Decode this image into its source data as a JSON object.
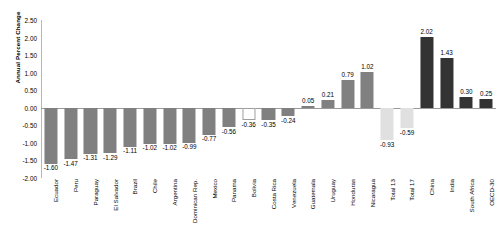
{
  "chart_data": {
    "type": "bar",
    "title": "",
    "xlabel": "",
    "ylabel": "Annual Percent Change",
    "ylim": [
      -2.0,
      2.5
    ],
    "ytick_labels": [
      "2.50",
      "2.00",
      "1.50",
      "1.00",
      "0.50",
      "0.00",
      "-0.50",
      "-1.00",
      "-1.50",
      "-2.00"
    ],
    "ytick_values": [
      2.5,
      2.0,
      1.5,
      1.0,
      0.5,
      0.0,
      -0.5,
      -1.0,
      -1.5,
      -2.0
    ],
    "grid": false,
    "legend": "none",
    "categories": [
      "Ecuador",
      "Peru",
      "Paraguay",
      "El Salvador",
      "Brazil",
      "Chile",
      "Argentina",
      "Dominican Rep.",
      "Mexico",
      "Panama",
      "Bolivia",
      "Costa Rica",
      "Venezuela",
      "Guatemala",
      "Uruguay",
      "Honduras",
      "Nicaragua",
      "Total 13",
      "Total 17",
      "China",
      "India",
      "South Africa",
      "OECD-30"
    ],
    "values": [
      -1.6,
      -1.47,
      -1.31,
      -1.29,
      -1.11,
      -1.02,
      -1.02,
      -0.99,
      -0.77,
      -0.56,
      -0.36,
      -0.35,
      -0.24,
      0.05,
      0.21,
      0.79,
      1.02,
      -0.93,
      -0.59,
      2.02,
      1.43,
      0.3,
      0.25
    ],
    "value_labels": [
      "-1.60",
      "-1.47",
      "-1.31",
      "-1.29",
      "-1.11",
      "-1.02",
      "-1.02",
      "-0.99",
      "-0.77",
      "-0.56",
      "-0.36",
      "-0.35",
      "-0.24",
      "0.05",
      "0.21",
      "0.79",
      "1.02",
      "-0.93",
      "-0.59",
      "2.02",
      "1.43",
      "0.30",
      "0.25"
    ],
    "bar_styles": [
      "medium",
      "medium",
      "medium",
      "medium",
      "medium",
      "medium",
      "medium",
      "medium",
      "medium",
      "medium",
      "hollow",
      "medium",
      "medium",
      "medium",
      "medium",
      "medium",
      "medium",
      "light",
      "light",
      "dark",
      "dark",
      "dark",
      "dark"
    ],
    "colors": {
      "medium": "#808080",
      "dark": "#333333",
      "light": "#e0e0e0",
      "hollow": "#ffffff",
      "hollow_border": "#9e9e9e",
      "axis": "#9a9a9a",
      "text": "#000000"
    }
  }
}
